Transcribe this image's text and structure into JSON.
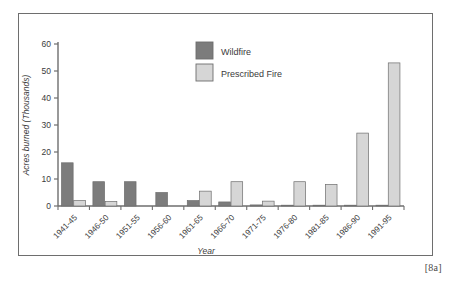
{
  "caption": "[8a]",
  "chart_data": {
    "type": "bar",
    "title": "",
    "xlabel": "Year",
    "ylabel": "Acres burned (Thousands)",
    "ylim": [
      0,
      60
    ],
    "yticks": [
      0,
      10,
      20,
      30,
      40,
      50,
      60
    ],
    "ytick_labels": [
      "0",
      "10",
      "20",
      "30",
      "40",
      "50",
      "60"
    ],
    "grid": false,
    "legend_position": "top-center",
    "categories": [
      "1941-45",
      "1946-50",
      "1951-55",
      "1956-60",
      "1961-65",
      "1966-70",
      "1971-75",
      "1976-80",
      "1981-85",
      "1986-90",
      "1991-95"
    ],
    "series": [
      {
        "name": "Wildfire",
        "color": "#7c7c7c",
        "values": [
          16,
          9,
          9,
          5,
          2,
          1.5,
          0.4,
          0.3,
          0.3,
          0.3,
          0.3
        ]
      },
      {
        "name": "Prescribed Fire",
        "color": "#d6d6d6",
        "values": [
          2,
          1.7,
          0,
          0,
          5.5,
          9,
          1.8,
          9,
          8,
          27,
          53
        ]
      }
    ]
  },
  "legend": {
    "items": [
      {
        "label": "Wildfire",
        "swatch": "#7c7c7c"
      },
      {
        "label": "Prescribed Fire",
        "swatch": "#d6d6d6"
      }
    ]
  },
  "colors": {
    "wildfire": "#7c7c7c",
    "prescribed_fire": "#d6d6d6",
    "axis": "#6e6e6e",
    "frame": "#6e6e6e",
    "text": "#3b3b3b"
  }
}
